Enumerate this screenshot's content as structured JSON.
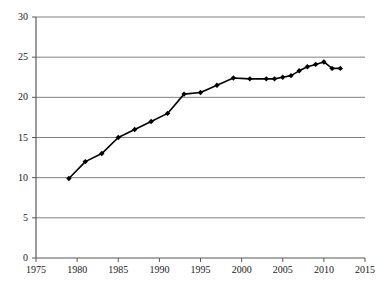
{
  "chart_data": {
    "type": "line",
    "title": "",
    "subtitle": "",
    "xlabel": "",
    "ylabel": "",
    "xlim": [
      1975,
      2015
    ],
    "ylim": [
      0,
      30
    ],
    "xticks": [
      1975,
      1980,
      1985,
      1990,
      1995,
      2000,
      2005,
      2010,
      2015
    ],
    "yticks": [
      0,
      5,
      10,
      15,
      20,
      25,
      30
    ],
    "grid": "horizontal",
    "legend": "none",
    "legend_entries": [],
    "annotations": [],
    "marker": "diamond",
    "line_color": "#000000",
    "marker_color": "#000000",
    "grid_color": "#808080",
    "axis_color": "#595959",
    "background": "#ffffff",
    "series": [
      {
        "name": "series-1",
        "x": [
          1979,
          1981,
          1983,
          1985,
          1987,
          1989,
          1991,
          1993,
          1995,
          1997,
          1999,
          2001,
          2003,
          2004,
          2005,
          2006,
          2007,
          2008,
          2009,
          2010,
          2011,
          2012
        ],
        "values": [
          9.9,
          12.0,
          13.0,
          15.0,
          16.0,
          17.0,
          18.0,
          20.4,
          20.6,
          21.5,
          22.4,
          22.3,
          22.3,
          22.3,
          22.5,
          22.7,
          23.3,
          23.8,
          24.1,
          24.4,
          23.6,
          23.6
        ]
      }
    ]
  }
}
